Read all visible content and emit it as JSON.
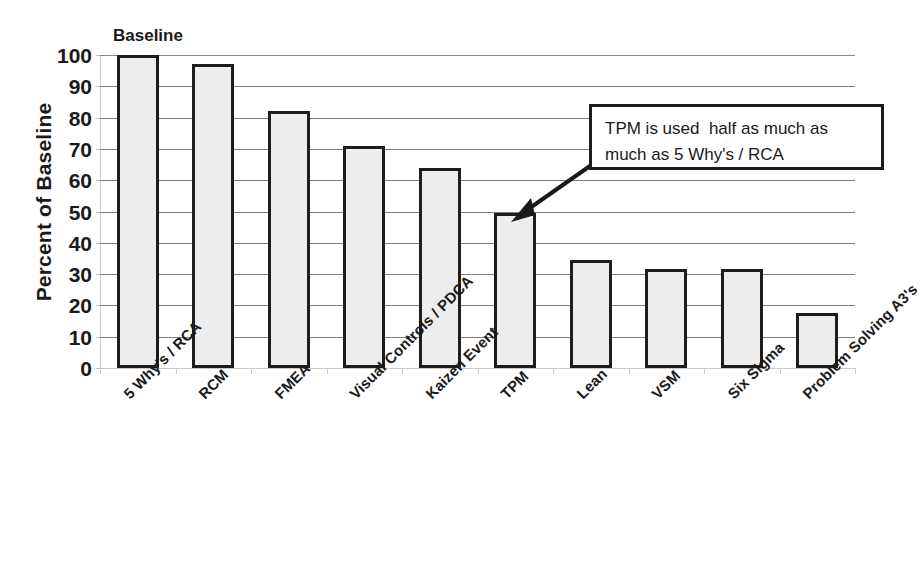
{
  "chart_data": {
    "type": "bar",
    "title": "",
    "series_label": "Baseline",
    "categories": [
      "5 Why's / RCA",
      "RCM",
      "FMEA",
      "Visual Controls / PDCA",
      "Kaizen Event",
      "TPM",
      "Lean",
      "VSM",
      "Six Sigma",
      "Problem Solving A3's"
    ],
    "values": [
      100,
      97,
      82,
      71,
      64,
      49.5,
      34.5,
      31.5,
      31.5,
      17.5
    ],
    "xlabel": "",
    "ylabel": "Percent of Baseline",
    "ylim": [
      0,
      100
    ],
    "ytick_step": 10,
    "ytick_labels": [
      "100",
      "90",
      "80",
      "70",
      "60",
      "50",
      "40",
      "30",
      "20",
      "10",
      "0"
    ],
    "grid": true,
    "legend": "none",
    "bar_fill_color": "#ededed",
    "bar_border_color": "#1d1d1d",
    "gridline_color": "#7e7e7e",
    "text_color": "#1a1a1a",
    "background_color": "#ffffff",
    "annotations": [
      {
        "name": "tpm-callout",
        "lines": [
          "TPM is used  half as much as",
          "much as 5 Why's / RCA"
        ],
        "points_to_category": "TPM"
      }
    ]
  }
}
